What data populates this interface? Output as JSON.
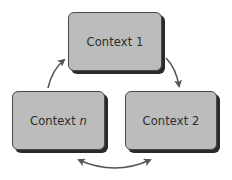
{
  "diagram": {
    "boxes": [
      {
        "id": "context-1",
        "label": "Context 1"
      },
      {
        "id": "context-2",
        "label": "Context 2"
      },
      {
        "id": "context-n",
        "label_prefix": "Context ",
        "label_suffix": "n"
      }
    ],
    "arrows": [
      {
        "from": "context-n",
        "to": "context-1",
        "type": "single"
      },
      {
        "from": "context-1",
        "to": "context-2",
        "type": "single"
      },
      {
        "between": [
          "context-2",
          "context-n"
        ],
        "type": "double"
      }
    ],
    "colors": {
      "box_fill": "#bcbcbc",
      "box_border": "#4a4a4a",
      "box_shadow": "#2a2a2a",
      "arrow": "#555555",
      "text": "#2e2e2e"
    }
  }
}
